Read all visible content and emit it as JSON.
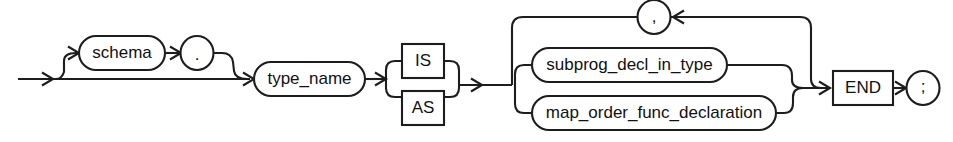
{
  "diagram": {
    "name": "create-type-body-syntax-railroad",
    "kind": "railroad-syntax-diagram",
    "colors": {
      "background": "#ffffff",
      "stroke": "#1d1d1d",
      "text": "#111111",
      "fill": "#ffffff"
    },
    "nodes": {
      "schema": {
        "label": "schema",
        "shape": "stadium",
        "role": "nonterminal"
      },
      "dot": {
        "label": ".",
        "shape": "circle",
        "role": "terminal"
      },
      "type_name": {
        "label": "type_name",
        "shape": "stadium",
        "role": "nonterminal"
      },
      "is": {
        "label": "IS",
        "shape": "rect",
        "role": "keyword"
      },
      "as": {
        "label": "AS",
        "shape": "rect",
        "role": "keyword"
      },
      "comma": {
        "label": ",",
        "shape": "circle",
        "role": "terminal"
      },
      "subprog": {
        "label": "subprog_decl_in_type",
        "shape": "stadium",
        "role": "nonterminal"
      },
      "map_order": {
        "label": "map_order_func_declaration",
        "shape": "stadium",
        "role": "nonterminal"
      },
      "end": {
        "label": "END",
        "shape": "rect",
        "role": "keyword"
      },
      "semicolon": {
        "label": ";",
        "shape": "circle",
        "role": "terminal"
      }
    },
    "arrows": {
      "entry": "entry-arrow",
      "to_schema": "arrow-into-schema",
      "to_dot": "arrow-into-dot",
      "to_type_name": "arrow-into-type-name",
      "to_choice": "arrow-into-is-as-choice",
      "to_body": "arrow-into-body-choice",
      "loop_back": "arrow-into-comma-loop",
      "to_end": "arrow-into-end",
      "to_semicolon": "arrow-into-semicolon"
    }
  }
}
